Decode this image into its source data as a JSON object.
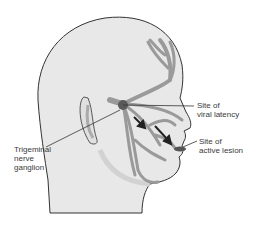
{
  "figure": {
    "labels": {
      "latency": "Site of\nviral latency",
      "lesion": "Site of\nactive lesion",
      "ganglion": "Trigeminal\nnerve\nganglion"
    },
    "colors": {
      "skin": "#e8e8e8",
      "outline": "#333333",
      "nerve": "#9a9a9a",
      "ganglion": "#5a5a5a",
      "arrow": "#222222",
      "text": "#3a3a3a"
    }
  }
}
